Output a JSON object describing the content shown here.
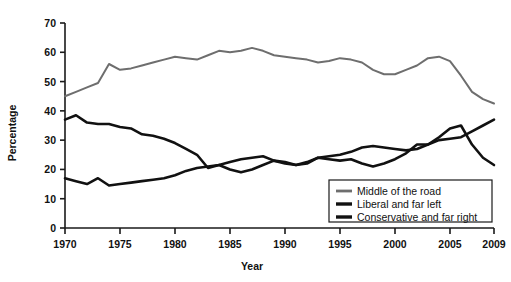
{
  "chart_data": {
    "type": "line",
    "title": "",
    "xlabel": "Year",
    "ylabel": "Percentage",
    "xlim": [
      1970,
      2009
    ],
    "ylim": [
      0,
      70
    ],
    "ytick_step": 10,
    "yticks": [
      0,
      10,
      20,
      30,
      40,
      50,
      60,
      70
    ],
    "xticks": [
      1970,
      1975,
      1980,
      1985,
      1990,
      1995,
      2000,
      2005,
      2009
    ],
    "x": [
      1970,
      1971,
      1972,
      1973,
      1974,
      1975,
      1976,
      1977,
      1978,
      1979,
      1980,
      1981,
      1982,
      1983,
      1984,
      1985,
      1986,
      1987,
      1988,
      1989,
      1990,
      1991,
      1992,
      1993,
      1994,
      1995,
      1996,
      1997,
      1998,
      1999,
      2000,
      2001,
      2002,
      2003,
      2004,
      2005,
      2006,
      2007,
      2008,
      2009
    ],
    "grid": false,
    "legend_position": "bottom-right",
    "series": [
      {
        "name": "Middle of the road",
        "color": "#6e6e6e",
        "width": 2.0,
        "values": [
          45,
          46.5,
          48,
          49.5,
          56,
          54,
          54.5,
          55.5,
          56.5,
          57.5,
          58.5,
          58,
          57.5,
          59,
          60.5,
          60,
          60.5,
          61.5,
          60.5,
          59,
          58.5,
          58,
          57.5,
          56.5,
          57,
          58,
          57.5,
          56.5,
          54,
          52.5,
          52.5,
          54,
          55.5,
          58,
          58.5,
          57,
          52,
          46.5,
          44,
          42.5
        ]
      },
      {
        "name": "Liberal and far left",
        "color": "#111111",
        "width": 2.6,
        "values": [
          17,
          16,
          15,
          17,
          14.5,
          15,
          15.5,
          16,
          16.5,
          17,
          18,
          19.5,
          20.5,
          21,
          21.5,
          22.5,
          23.5,
          24,
          24.5,
          23,
          22.5,
          21.5,
          22.5,
          24,
          24.5,
          25,
          26,
          27.5,
          28,
          27.5,
          27,
          26.5,
          27,
          28.5,
          30,
          30.5,
          31,
          33,
          35,
          37
        ]
      },
      {
        "name": "Conservative and far right",
        "color": "#111111",
        "width": 2.6,
        "values": [
          37,
          38.5,
          36,
          35.5,
          35.5,
          34.5,
          34,
          32,
          31.5,
          30.5,
          29,
          27,
          25,
          20.5,
          21.5,
          20,
          19,
          20,
          21.5,
          23,
          22,
          21.5,
          22,
          24,
          23.5,
          23,
          23.5,
          22,
          21,
          22,
          23.5,
          25.5,
          28.5,
          28.5,
          31,
          34,
          35,
          28.5,
          24,
          21.5
        ]
      }
    ]
  },
  "legend": {
    "items": [
      {
        "label": "Middle of the road"
      },
      {
        "label": "Liberal and far left"
      },
      {
        "label": "Conservative and far right"
      }
    ]
  },
  "axes": {
    "y_title": "Percentage",
    "x_title": "Year"
  }
}
